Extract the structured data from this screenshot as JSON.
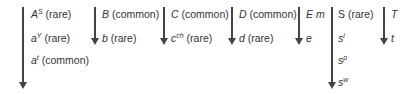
{
  "diagram": {
    "type": "allele-dominance-series",
    "loci": [
      {
        "name": "A",
        "alleles": [
          {
            "symbol": "A",
            "sup": "S",
            "note": "(rare)"
          },
          {
            "symbol": "a",
            "sup": "Y",
            "note": "(rare)"
          },
          {
            "symbol": "a",
            "sup": "t",
            "note": "(common)"
          }
        ]
      },
      {
        "name": "B",
        "alleles": [
          {
            "symbol": "B",
            "sup": "",
            "note": "(common)"
          },
          {
            "symbol": "b",
            "sup": "",
            "note": "(rare)"
          }
        ]
      },
      {
        "name": "C",
        "alleles": [
          {
            "symbol": "C",
            "sup": "",
            "note": "(common)"
          },
          {
            "symbol": "c",
            "sup": "ch",
            "note": "(rare)"
          }
        ]
      },
      {
        "name": "D",
        "alleles": [
          {
            "symbol": "D",
            "sup": "",
            "note": "(common)"
          },
          {
            "symbol": "d",
            "sup": "",
            "note": "(rare)"
          }
        ]
      },
      {
        "name": "E",
        "alleles": [
          {
            "symbol": "E m",
            "sup": "",
            "note": ""
          },
          {
            "symbol": "e",
            "sup": "",
            "note": ""
          }
        ]
      },
      {
        "name": "S",
        "alleles": [
          {
            "symbol": "S",
            "sup": "",
            "note": "(rare)"
          },
          {
            "symbol": "s",
            "sup": "i",
            "note": ""
          },
          {
            "symbol": "s",
            "sup": "p",
            "note": ""
          },
          {
            "symbol": "s",
            "sup": "w",
            "note": ""
          }
        ]
      },
      {
        "name": "T",
        "alleles": [
          {
            "symbol": "T",
            "sup": "",
            "note": ""
          },
          {
            "symbol": "t",
            "sup": "",
            "note": ""
          }
        ]
      }
    ],
    "colors": {
      "arrow": "#444444",
      "text": "#333333"
    }
  }
}
